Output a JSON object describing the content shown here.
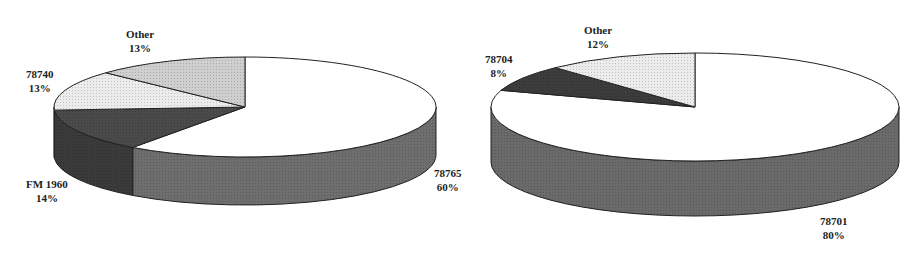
{
  "chart_data": [
    {
      "type": "pie",
      "style": "3d",
      "title": "",
      "categories": [
        "78765",
        "FM 1960",
        "78740",
        "Other"
      ],
      "values": [
        60,
        14,
        13,
        13
      ],
      "value_labels": [
        "60%",
        "14%",
        "13%",
        "13%"
      ],
      "legend": "none",
      "labels_position": "outside",
      "slice_fills": [
        "#ffffff",
        "#4a4a4a",
        "#ececec",
        "#cfcfcf"
      ],
      "side_fills": [
        "#6e6e6e",
        "#3a3a3a",
        "#9a9a9a",
        "#9a9a9a"
      ]
    },
    {
      "type": "pie",
      "style": "3d",
      "title": "",
      "categories": [
        "78701",
        "78704",
        "Other"
      ],
      "values": [
        80,
        8,
        12
      ],
      "value_labels": [
        "80%",
        "8%",
        "12%"
      ],
      "legend": "none",
      "labels_position": "outside",
      "slice_fills": [
        "#ffffff",
        "#3c3c3c",
        "#ececec"
      ],
      "side_fills": [
        "#6a6a6a",
        "#333333",
        "#a0a0a0"
      ]
    }
  ],
  "labels": {
    "left": [
      {
        "name": "78765",
        "pct": "60%"
      },
      {
        "name": "FM 1960",
        "pct": "14%"
      },
      {
        "name": "78740",
        "pct": "13%"
      },
      {
        "name": "Other",
        "pct": "13%"
      }
    ],
    "right": [
      {
        "name": "78701",
        "pct": "80%"
      },
      {
        "name": "78704",
        "pct": "8%"
      },
      {
        "name": "Other",
        "pct": "12%"
      }
    ]
  }
}
